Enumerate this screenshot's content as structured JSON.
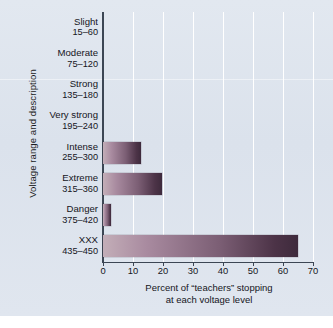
{
  "chart_data": {
    "type": "bar",
    "orientation": "horizontal",
    "title": "",
    "xlabel_line1": "Percent of “teachers” stopping",
    "xlabel_line2": "at each voltage level",
    "ylabel": "Voltage range and description",
    "xlim": [
      0,
      70
    ],
    "xticks": [
      0,
      10,
      20,
      30,
      40,
      50,
      60,
      70
    ],
    "xtick_labels": [
      "0",
      "10",
      "20",
      "30",
      "40",
      "50",
      "60",
      "70"
    ],
    "grid": "vertical",
    "legend": "none",
    "categories": [
      {
        "name": "Slight",
        "range": "15–60"
      },
      {
        "name": "Moderate",
        "range": "75–120"
      },
      {
        "name": "Strong",
        "range": "135–180"
      },
      {
        "name": "Very strong",
        "range": "195–240"
      },
      {
        "name": "Intense",
        "range": "255–300"
      },
      {
        "name": "Extreme",
        "range": "315–360"
      },
      {
        "name": "Danger",
        "range": "375–420"
      },
      {
        "name": "XXX",
        "range": "435–450"
      }
    ],
    "values": [
      0,
      0,
      0,
      0,
      12.5,
      19.5,
      2.5,
      65
    ],
    "bar_color_start": "#c3aeb8",
    "bar_color_end": "#3e2a3c",
    "background_color": "#dfe5ee",
    "gridline_color": "#ffffff",
    "axis_color": "#3c4654"
  }
}
